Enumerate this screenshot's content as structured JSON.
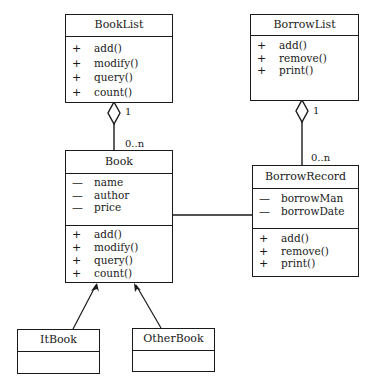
{
  "diagram": {
    "type": "uml-class-diagram",
    "classes": [
      {
        "id": "booklist",
        "name": "BookList",
        "attributes": [],
        "operations": [
          {
            "visibility": "+",
            "name": "add()"
          },
          {
            "visibility": "+",
            "name": "modify()"
          },
          {
            "visibility": "+",
            "name": "query()"
          },
          {
            "visibility": "+",
            "name": "count()"
          }
        ]
      },
      {
        "id": "borrowlist",
        "name": "BorrowList",
        "attributes": [],
        "operations": [
          {
            "visibility": "+",
            "name": "add()"
          },
          {
            "visibility": "+",
            "name": "remove()"
          },
          {
            "visibility": "+",
            "name": "print()"
          }
        ]
      },
      {
        "id": "book",
        "name": "Book",
        "attributes": [
          {
            "visibility": "—",
            "name": "name"
          },
          {
            "visibility": "—",
            "name": "author"
          },
          {
            "visibility": "—",
            "name": "price"
          }
        ],
        "operations": [
          {
            "visibility": "+",
            "name": "add()"
          },
          {
            "visibility": "+",
            "name": "modify()"
          },
          {
            "visibility": "+",
            "name": "query()"
          },
          {
            "visibility": "+",
            "name": "count()"
          }
        ]
      },
      {
        "id": "borrowrecord",
        "name": "BorrowRecord",
        "attributes": [
          {
            "visibility": "—",
            "name": "borrowMan"
          },
          {
            "visibility": "—",
            "name": "borrowDate"
          }
        ],
        "operations": [
          {
            "visibility": "+",
            "name": "add()"
          },
          {
            "visibility": "+",
            "name": "remove()"
          },
          {
            "visibility": "+",
            "name": "print()"
          }
        ]
      },
      {
        "id": "itbook",
        "name": "ItBook",
        "attributes": [],
        "operations": []
      },
      {
        "id": "otherbook",
        "name": "OtherBook",
        "attributes": [],
        "operations": []
      }
    ],
    "relationships": [
      {
        "type": "aggregation",
        "whole": "BookList",
        "part": "Book",
        "whole_multiplicity": "1",
        "part_multiplicity": "0..n"
      },
      {
        "type": "aggregation",
        "whole": "BorrowList",
        "part": "BorrowRecord",
        "whole_multiplicity": "1",
        "part_multiplicity": "0..n"
      },
      {
        "type": "association",
        "from": "Book",
        "to": "BorrowRecord"
      },
      {
        "type": "generalization",
        "child": "ItBook",
        "parent": "Book"
      },
      {
        "type": "generalization",
        "child": "OtherBook",
        "parent": "Book"
      }
    ],
    "colors": {
      "line": "#1a1a1a",
      "background": "#ffffff"
    }
  }
}
